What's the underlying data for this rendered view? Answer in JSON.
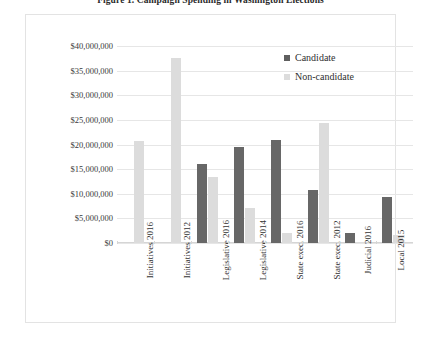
{
  "caption": "Figure 1. Campaign Spending in Washington Elections",
  "legend": {
    "position": "top-right",
    "items": [
      {
        "label": "Candidate",
        "color": "#5f5f5f",
        "swatch": "square-swatch-icon"
      },
      {
        "label": "Non-candidate",
        "color": "#dcdcdc",
        "swatch": "square-swatch-icon"
      }
    ]
  },
  "yaxis": {
    "ticks": [
      "$0",
      "$5,000,000",
      "$10,000,000",
      "$15,000,000",
      "$20,000,000",
      "$25,000,000",
      "$30,000,000",
      "$35,000,000",
      "$40,000,000"
    ]
  },
  "chart_data": {
    "type": "bar",
    "title": "Figure 1. Campaign Spending in Washington Elections",
    "xlabel": "",
    "ylabel": "",
    "ylim": [
      0,
      40000000
    ],
    "ytick_step": 5000000,
    "grid": true,
    "legend_position": "top-right",
    "categories": [
      "Initiatives 2016",
      "Initiatives 2012",
      "Legislative 2016",
      "Legislative 2014",
      "State exec. 2016",
      "State exec. 2012",
      "Judicial 2016",
      "Local 2015"
    ],
    "series": [
      {
        "name": "Candidate",
        "color": "#676767",
        "values": [
          0,
          0,
          16100000,
          19400000,
          20900000,
          10700000,
          2000000,
          9300000
        ]
      },
      {
        "name": "Non-candidate",
        "color": "#dcdcdc",
        "values": [
          20800000,
          37600000,
          13500000,
          7200000,
          2000000,
          24400000,
          300000,
          1600000
        ]
      }
    ]
  }
}
